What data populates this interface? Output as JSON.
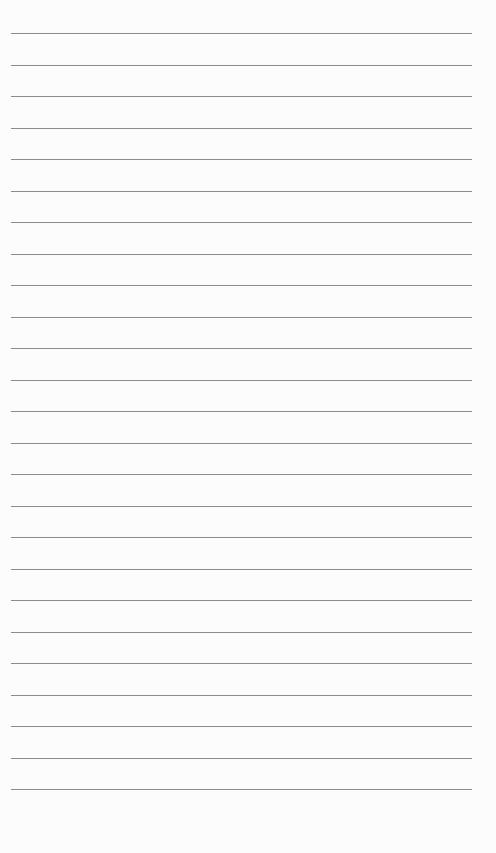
{
  "page": {
    "type": "lined-paper",
    "background_color": "#fcfcfc",
    "line_color": "#8c8c8c",
    "line_count": 25,
    "first_line_y": 33,
    "line_spacing": 31.5,
    "line_left": 11,
    "line_width": 461
  }
}
